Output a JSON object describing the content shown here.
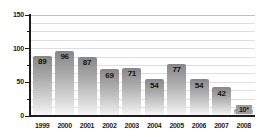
{
  "chart_data": {
    "type": "bar",
    "title": "",
    "xlabel": "",
    "ylabel": "",
    "categories": [
      "1999",
      "2000",
      "2001",
      "2002",
      "2003",
      "2004",
      "2005",
      "2006",
      "2007",
      "2008"
    ],
    "values": [
      89,
      96,
      87,
      69,
      71,
      54,
      77,
      54,
      42,
      10
    ],
    "bar_labels": [
      "89",
      "96",
      "87",
      "69",
      "71",
      "54",
      "77",
      "54",
      "42",
      "10*"
    ],
    "ylim": [
      0,
      150
    ],
    "yticks": [
      0,
      50,
      100,
      150
    ],
    "ytick_labels": [
      "0",
      "50",
      "100",
      "150"
    ],
    "yticks_minor": [
      25,
      75,
      125
    ],
    "grid": true,
    "grid_step": 12.5,
    "legend": "none",
    "colors": {
      "bar_top": "#878787",
      "bar_bottom": "#f7f7f7",
      "grid": "#dedede",
      "grid_top": "#c2c2c2",
      "axis": "#1c1c1c",
      "value_label": "#141414",
      "tick_label": "#1a1a1a"
    }
  }
}
